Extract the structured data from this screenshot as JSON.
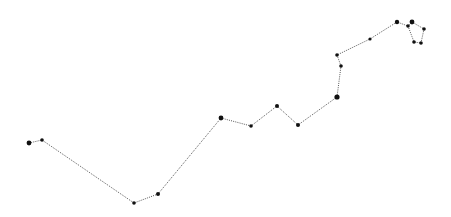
{
  "diagram": {
    "type": "polyline-path",
    "background": "#ffffff",
    "line_color": "#555555",
    "line_style": "dotted",
    "node_color": "#111111",
    "points": [
      {
        "x": 29,
        "y": 143,
        "r": 2.4
      },
      {
        "x": 42,
        "y": 140,
        "r": 1.8
      },
      {
        "x": 134,
        "y": 203,
        "r": 1.8
      },
      {
        "x": 158,
        "y": 194,
        "r": 2.0
      },
      {
        "x": 221,
        "y": 118,
        "r": 2.4
      },
      {
        "x": 251,
        "y": 126,
        "r": 1.8
      },
      {
        "x": 277,
        "y": 106,
        "r": 2.0
      },
      {
        "x": 298,
        "y": 125,
        "r": 2.0
      },
      {
        "x": 337,
        "y": 97,
        "r": 2.6
      },
      {
        "x": 341,
        "y": 66,
        "r": 1.8
      },
      {
        "x": 337,
        "y": 55,
        "r": 1.8
      },
      {
        "x": 370,
        "y": 39,
        "r": 1.6
      },
      {
        "x": 397,
        "y": 22,
        "r": 2.2
      },
      {
        "x": 408,
        "y": 26,
        "r": 1.8
      },
      {
        "x": 414,
        "y": 42,
        "r": 1.8
      },
      {
        "x": 421,
        "y": 43,
        "r": 1.8
      },
      {
        "x": 424,
        "y": 29,
        "r": 1.8
      },
      {
        "x": 412,
        "y": 22,
        "r": 2.4
      },
      {
        "x": 408,
        "y": 26,
        "r": 0
      }
    ]
  }
}
